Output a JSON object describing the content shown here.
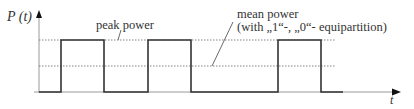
{
  "diagram": {
    "y_axis_label": "P (t)",
    "x_axis_label": "t",
    "peak_label": "peak power",
    "mean_label_line1": "mean power",
    "mean_label_line2": "(with „1“-, „0“- equipartition)",
    "levels": {
      "peak": 40,
      "mean": 66,
      "zero": 92
    },
    "pulses": [
      {
        "start": 61,
        "end": 104
      },
      {
        "start": 148,
        "end": 191
      },
      {
        "start": 278,
        "end": 321
      }
    ],
    "colors": {
      "signal": "#333333",
      "axis": "#999999",
      "dotted": "#555555"
    }
  }
}
